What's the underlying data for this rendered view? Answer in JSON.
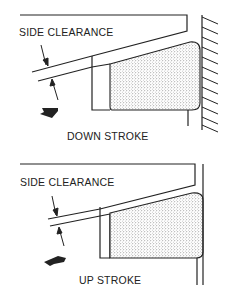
{
  "diagrams": [
    {
      "title": "DOWN STROKE",
      "dimension_label": "SIDE CLEARANCE",
      "motion_arrow": "down-arrow"
    },
    {
      "title": "UP STROKE",
      "dimension_label": "SIDE CLEARANCE",
      "motion_arrow": "up-arrow"
    }
  ],
  "colors": {
    "line": "#222222",
    "stipple": "#555555",
    "background": "#ffffff"
  }
}
